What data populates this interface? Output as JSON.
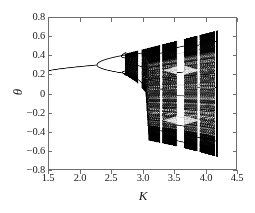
{
  "figure": {
    "kind": "bifurcation-diagram",
    "background_color": "#ffffff",
    "ink_color": "#000000",
    "axis_color": "#6e6e6e"
  },
  "axes": {
    "x_title": "K",
    "y_title": "θ",
    "x_tick_labels": [
      "1.5",
      "2.0",
      "2.5",
      "3.0",
      "3.5",
      "4.0",
      "4.5"
    ],
    "y_tick_labels": [
      "0.8",
      "0.6",
      "0.4",
      "0.2",
      "0",
      "−0.2",
      "−0.4",
      "−0.6",
      "−0.8"
    ]
  },
  "chart_data": {
    "type": "scatter",
    "title": "",
    "subtitle": "",
    "xlabel": "K",
    "ylabel": "θ",
    "xlim": [
      1.5,
      4.5
    ],
    "ylim": [
      -0.8,
      0.8
    ],
    "xticks": [
      1.5,
      2.0,
      2.5,
      3.0,
      3.5,
      4.0,
      4.5
    ],
    "yticks": [
      -0.8,
      -0.6,
      -0.4,
      -0.2,
      0,
      0.2,
      0.4,
      0.6,
      0.8
    ],
    "grid": false,
    "legend": null,
    "annotations": [],
    "point_color": "#000000",
    "point_size": 0.55,
    "data_k_start": 1.5,
    "data_k_end": 4.2,
    "branches": [
      {
        "name": "fixed-point",
        "k_range": [
          1.5,
          2.27
        ],
        "theta_start": 0.24,
        "theta_end": 0.302
      },
      {
        "name": "period-2-upper",
        "k_range": [
          2.27,
          2.72
        ],
        "theta_start": 0.302,
        "theta_end": 0.408
      },
      {
        "name": "period-2-lower",
        "k_range": [
          2.27,
          2.72
        ],
        "theta_start": 0.302,
        "theta_end": 0.213
      }
    ],
    "bifurcation_points": [
      {
        "k": 2.27,
        "theta": 0.302,
        "order": 1
      },
      {
        "k": 2.66,
        "theta": 0.395,
        "order": 2
      },
      {
        "k": 2.68,
        "theta": 0.225,
        "order": 2
      }
    ],
    "chaos_onset_k": 2.72,
    "band_merging_k": 3.1,
    "upper_envelope": [
      {
        "k": 2.72,
        "theta": 0.42
      },
      {
        "k": 3.0,
        "theta": 0.465
      },
      {
        "k": 3.3,
        "theta": 0.515
      },
      {
        "k": 3.6,
        "theta": 0.565
      },
      {
        "k": 3.9,
        "theta": 0.615
      },
      {
        "k": 4.2,
        "theta": 0.665
      }
    ],
    "lower_envelope": [
      {
        "k": 2.72,
        "theta": 0.205
      },
      {
        "k": 2.9,
        "theta": 0.13
      },
      {
        "k": 3.05,
        "theta": 0.02
      },
      {
        "k": 3.1,
        "theta": -0.49
      },
      {
        "k": 3.5,
        "theta": -0.545
      },
      {
        "k": 3.9,
        "theta": -0.61
      },
      {
        "k": 4.2,
        "theta": -0.665
      }
    ],
    "periodic_windows": [
      {
        "k_start": 2.93,
        "k_end": 2.985,
        "width": 0.055
      },
      {
        "k_start": 3.28,
        "k_end": 3.315,
        "width": 0.035
      },
      {
        "k_start": 3.55,
        "k_end": 3.665,
        "width": 0.115
      },
      {
        "k_start": 3.88,
        "k_end": 3.915,
        "width": 0.035
      },
      {
        "k_start": 4.16,
        "k_end": 4.185,
        "width": 0.025
      }
    ],
    "interior_light_structures": [
      {
        "name": "upper-interior-fold",
        "k": 3.62,
        "theta": 0.25
      },
      {
        "name": "lower-interior-fold",
        "k": 3.62,
        "theta": -0.28
      }
    ]
  }
}
